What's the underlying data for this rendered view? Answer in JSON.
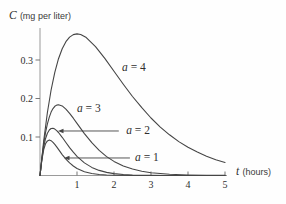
{
  "chart_data": {
    "type": "line",
    "title": "",
    "xlabel": "t (hours)",
    "ylabel": "C (mg per liter)",
    "grid": false,
    "legend_position": "inline-annotations",
    "x_axis": {
      "variable": "t",
      "unit": "(hours)",
      "range": [
        0,
        5.05
      ],
      "ticks": [
        1,
        2,
        3,
        4,
        5
      ],
      "tick_labels": [
        "1",
        "2",
        "3",
        "4",
        "5"
      ]
    },
    "y_axis": {
      "variable": "C",
      "unit": "(mg per liter)",
      "range": [
        0,
        0.38
      ],
      "ticks": [
        0.1,
        0.2,
        0.3
      ],
      "tick_labels": [
        "0.1",
        "0.2",
        "0.3"
      ]
    },
    "series": [
      {
        "name": "a = 4",
        "parameter": 4,
        "peak": {
          "t": 1.0,
          "c": 0.368
        },
        "points": [
          [
            0,
            0
          ],
          [
            0.1,
            0.0905
          ],
          [
            0.2,
            0.1637
          ],
          [
            0.3,
            0.2222
          ],
          [
            0.4,
            0.2681
          ],
          [
            0.5,
            0.3033
          ],
          [
            0.6,
            0.3293
          ],
          [
            0.7,
            0.3476
          ],
          [
            0.8,
            0.3595
          ],
          [
            0.9,
            0.3659
          ],
          [
            1,
            0.3679
          ],
          [
            1.1,
            0.3662
          ],
          [
            1.25,
            0.3581
          ],
          [
            1.5,
            0.3347
          ],
          [
            1.75,
            0.3041
          ],
          [
            2,
            0.2707
          ],
          [
            2.25,
            0.2372
          ],
          [
            2.5,
            0.2052
          ],
          [
            2.75,
            0.176
          ],
          [
            3,
            0.1494
          ],
          [
            3.25,
            0.1258
          ],
          [
            3.5,
            0.1057
          ],
          [
            3.75,
            0.0881
          ],
          [
            4,
            0.0733
          ],
          [
            4.25,
            0.0607
          ],
          [
            4.5,
            0.05
          ],
          [
            4.75,
            0.0411
          ],
          [
            5,
            0.0337
          ]
        ]
      },
      {
        "name": "a = 3",
        "parameter": 3,
        "peak": {
          "t": 0.5,
          "c": 0.184
        },
        "points": [
          [
            0,
            0
          ],
          [
            0.05,
            0.0452
          ],
          [
            0.1,
            0.0819
          ],
          [
            0.15,
            0.1111
          ],
          [
            0.2,
            0.1341
          ],
          [
            0.25,
            0.1516
          ],
          [
            0.3,
            0.1646
          ],
          [
            0.35,
            0.1738
          ],
          [
            0.4,
            0.1797
          ],
          [
            0.45,
            0.1829
          ],
          [
            0.5,
            0.1839
          ],
          [
            0.6,
            0.1807
          ],
          [
            0.7,
            0.1725
          ],
          [
            0.8,
            0.1615
          ],
          [
            0.9,
            0.1488
          ],
          [
            1,
            0.1353
          ],
          [
            1.2,
            0.1088
          ],
          [
            1.4,
            0.0852
          ],
          [
            1.6,
            0.0653
          ],
          [
            1.8,
            0.0492
          ],
          [
            2,
            0.0366
          ],
          [
            2.25,
            0.025
          ],
          [
            2.5,
            0.0168
          ],
          [
            2.75,
            0.0112
          ],
          [
            3,
            0.0074
          ],
          [
            3.5,
            0.0032
          ],
          [
            4,
            0.0013
          ],
          [
            4.5,
            0.0005
          ],
          [
            5,
            0.0002
          ]
        ]
      },
      {
        "name": "a = 2",
        "parameter": 2,
        "peak": {
          "t": 0.33,
          "c": 0.123
        },
        "points": [
          [
            0,
            0
          ],
          [
            0.05,
            0.043
          ],
          [
            0.1,
            0.0741
          ],
          [
            0.15,
            0.0956
          ],
          [
            0.2,
            0.1098
          ],
          [
            0.25,
            0.1181
          ],
          [
            0.3,
            0.122
          ],
          [
            0.35,
            0.1225
          ],
          [
            0.4,
            0.1205
          ],
          [
            0.45,
            0.1166
          ],
          [
            0.5,
            0.1116
          ],
          [
            0.6,
            0.0992
          ],
          [
            0.7,
            0.0857
          ],
          [
            0.8,
            0.0725
          ],
          [
            0.9,
            0.0604
          ],
          [
            1,
            0.0498
          ],
          [
            1.2,
            0.0328
          ],
          [
            1.4,
            0.021
          ],
          [
            1.6,
            0.0132
          ],
          [
            1.8,
            0.0081
          ],
          [
            2,
            0.005
          ],
          [
            2.25,
            0.0026
          ],
          [
            2.5,
            0.0014
          ],
          [
            3,
            0.0004
          ],
          [
            3.5,
            0.0001
          ],
          [
            4,
            0
          ],
          [
            5,
            0
          ]
        ]
      },
      {
        "name": "a = 1",
        "parameter": 1,
        "peak": {
          "t": 0.25,
          "c": 0.092
        },
        "points": [
          [
            0,
            0
          ],
          [
            0.05,
            0.0409
          ],
          [
            0.1,
            0.067
          ],
          [
            0.15,
            0.0823
          ],
          [
            0.2,
            0.0899
          ],
          [
            0.25,
            0.092
          ],
          [
            0.3,
            0.0904
          ],
          [
            0.35,
            0.0863
          ],
          [
            0.4,
            0.0808
          ],
          [
            0.45,
            0.0744
          ],
          [
            0.5,
            0.0677
          ],
          [
            0.6,
            0.0544
          ],
          [
            0.7,
            0.0426
          ],
          [
            0.8,
            0.0326
          ],
          [
            0.9,
            0.0246
          ],
          [
            1,
            0.0183
          ],
          [
            1.2,
            0.0099
          ],
          [
            1.4,
            0.0052
          ],
          [
            1.6,
            0.0027
          ],
          [
            1.8,
            0.0013
          ],
          [
            2,
            0.0007
          ],
          [
            2.5,
            0.0001
          ],
          [
            3,
            0
          ],
          [
            5,
            0
          ]
        ]
      }
    ],
    "annotations": [
      {
        "variable": "a",
        "value": "4",
        "label": "a = 4",
        "t": 2.54,
        "c": 0.282,
        "arrow": null
      },
      {
        "variable": "a",
        "value": "3",
        "label": "a = 3",
        "t": 1.32,
        "c": 0.175,
        "arrow": null
      },
      {
        "variable": "a",
        "value": "2",
        "label": "a = 2",
        "t": 2.65,
        "c": 0.118,
        "arrow": {
          "from_t": 2.13,
          "from_c": 0.1156,
          "to_t": 0.486,
          "to_c": 0.1156
        }
      },
      {
        "variable": "a",
        "value": "1",
        "label": "a = 1",
        "t": 2.89,
        "c": 0.048,
        "arrow": {
          "from_t": 2.43,
          "from_c": 0.0455,
          "to_t": 0.649,
          "to_c": 0.0455
        }
      }
    ],
    "colors": {
      "curve": "#454545",
      "axis": "#9a9a9a",
      "tick": "#777777",
      "text": "#2e2e2e",
      "background": "#fefefe"
    }
  }
}
